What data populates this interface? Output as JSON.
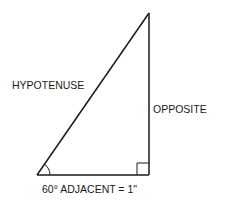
{
  "diagram": {
    "type": "right-triangle",
    "labels": {
      "hypotenuse": "HYPOTENUSE",
      "opposite": "OPPOSITE",
      "adjacent": "60° ADJACENT = 1\""
    },
    "angle_marker": "60°",
    "right_angle_marker": true,
    "colors": {
      "stroke": "#1a1a1a",
      "background": "#ffffff"
    }
  }
}
